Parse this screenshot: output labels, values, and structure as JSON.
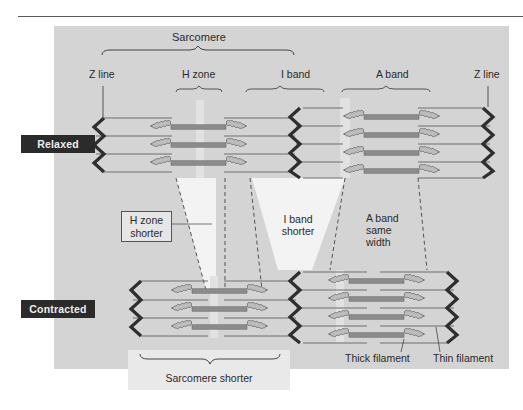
{
  "figure": {
    "top_label": "Sarcomere",
    "relaxed": {
      "state_label": "Relaxed",
      "labels": {
        "z_line_left": "Z line",
        "h_zone": "H zone",
        "i_band": "I band",
        "a_band": "A band",
        "z_line_right": "Z line"
      }
    },
    "comparison": {
      "h_zone": "H zone\nshorter",
      "h_zone_line1": "H zone",
      "h_zone_line2": "shorter",
      "i_band_line1": "I band",
      "i_band_line2": "shorter",
      "a_band_line1": "A band",
      "a_band_line2": "same",
      "a_band_line3": "width"
    },
    "contracted": {
      "state_label": "Contracted",
      "sarcomere_label": "Sarcomere shorter",
      "thick_filament": "Thick filament",
      "thin_filament": "Thin filament"
    },
    "colors": {
      "panel": "#d4d4d4",
      "highlight": "#f4f4f4",
      "z_line": "#2e2e2e",
      "thick_filament_core": "#8c8c8c",
      "thick_filament_heads": "#bdbdbd",
      "thin_filament": "#6e6e6e",
      "state_badge": "#2b2b2b"
    }
  }
}
